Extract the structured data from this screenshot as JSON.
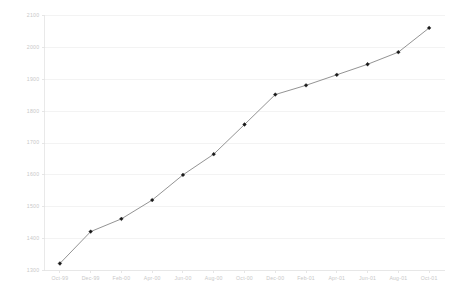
{
  "chart_data": {
    "type": "line",
    "title": "",
    "subtitle": "",
    "xlabel": "",
    "ylabel": "",
    "categories": [
      "Oct-99",
      "Dec-99",
      "Feb-00",
      "Apr-00",
      "Jun-00",
      "Aug-00",
      "Oct-00",
      "Dec-00",
      "Feb-01",
      "Apr-01",
      "Jun-01",
      "Aug-01",
      "Oct-01"
    ],
    "values": [
      1322,
      1422,
      1462,
      1521,
      1600,
      1665,
      1758,
      1852,
      1881,
      1914,
      1947,
      1985,
      2061
    ],
    "series": [
      {
        "name": "Series 1",
        "values": [
          1322,
          1422,
          1462,
          1521,
          1600,
          1665,
          1758,
          1852,
          1881,
          1914,
          1947,
          1985,
          2061
        ]
      }
    ],
    "ylim": [
      1300,
      2100
    ],
    "ytick_labels": [
      "2100",
      "2000",
      "1900",
      "1800",
      "1700",
      "1600",
      "1500",
      "1400",
      "1300"
    ],
    "ytick_values": [
      2100,
      2000,
      1900,
      1800,
      1700,
      1600,
      1500,
      1400,
      1300
    ],
    "ytick_step": 100,
    "xtick_labels": [
      "Oct-99",
      "Dec-99",
      "Feb-00",
      "Apr-00",
      "Jun-00",
      "Aug-00",
      "Oct-00",
      "Dec-00",
      "Feb-01",
      "Apr-01",
      "Jun-01",
      "Aug-01",
      "Oct-01"
    ],
    "grid": true,
    "grid_axis": "y",
    "legend": false,
    "legend_position": "none",
    "marker": "diamond",
    "colors": {
      "line": "#808080",
      "marker": "#1a1a1a",
      "grid": "#eeeeee",
      "axis": "#e4e4e4",
      "tick_text": "#c8c8c8",
      "background": "#ffffff"
    }
  }
}
